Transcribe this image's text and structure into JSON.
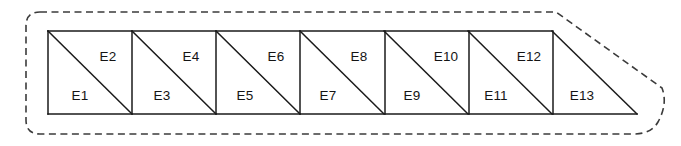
{
  "diagram": {
    "kind": "triangular-element-mesh",
    "colors": {
      "background": "#ffffff",
      "mesh_stroke": "#1a1a1a",
      "boundary_stroke": "#3b3b3b",
      "label_text": "#141414",
      "cell_fill": "#ffffff"
    },
    "geometry": {
      "mesh_left": 48,
      "mesh_top": 31,
      "mesh_bottom": 114,
      "cell_size": 84,
      "cell_count": 6,
      "tip_x": 637,
      "boundary_left": 26,
      "boundary_top": 12,
      "boundary_bottom": 134,
      "boundary_right": 668,
      "boundary_corner_radius": 14
    },
    "boundary": {
      "name": "domain-boundary",
      "style": "dashed",
      "dash_length": 7,
      "dash_gap": 4.5
    },
    "elements": [
      {
        "label": "E1",
        "cell": 0,
        "half": "lower-left",
        "lx": 80,
        "ly": 96
      },
      {
        "label": "E2",
        "cell": 0,
        "half": "upper-right",
        "lx": 108,
        "ly": 57
      },
      {
        "label": "E3",
        "cell": 1,
        "half": "lower-left",
        "lx": 162,
        "ly": 96
      },
      {
        "label": "E4",
        "cell": 1,
        "half": "upper-right",
        "lx": 191,
        "ly": 57
      },
      {
        "label": "E5",
        "cell": 2,
        "half": "lower-left",
        "lx": 245,
        "ly": 96
      },
      {
        "label": "E6",
        "cell": 2,
        "half": "upper-right",
        "lx": 276,
        "ly": 57
      },
      {
        "label": "E7",
        "cell": 3,
        "half": "lower-left",
        "lx": 328,
        "ly": 96
      },
      {
        "label": "E8",
        "cell": 3,
        "half": "upper-right",
        "lx": 359,
        "ly": 57
      },
      {
        "label": "E9",
        "cell": 4,
        "half": "lower-left",
        "lx": 412,
        "ly": 96
      },
      {
        "label": "E10",
        "cell": 4,
        "half": "upper-right",
        "lx": 446,
        "ly": 57
      },
      {
        "label": "E11",
        "cell": 5,
        "half": "lower-left",
        "lx": 496,
        "ly": 96
      },
      {
        "label": "E12",
        "cell": 5,
        "half": "upper-right",
        "lx": 529,
        "ly": 57
      },
      {
        "label": "E13",
        "cell": 6,
        "half": "single-triangle",
        "lx": 582,
        "ly": 96
      }
    ],
    "cell_dividers": [
      {
        "name": "divider-1",
        "x": 132
      },
      {
        "name": "divider-2",
        "x": 216
      },
      {
        "name": "divider-3",
        "x": 300
      },
      {
        "name": "divider-4",
        "x": 385
      },
      {
        "name": "divider-5",
        "x": 469
      },
      {
        "name": "divider-6",
        "x": 553
      }
    ]
  }
}
